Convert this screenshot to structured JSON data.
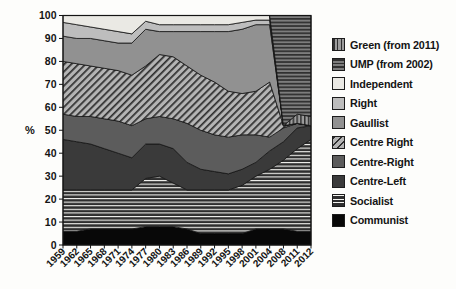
{
  "figure": {
    "ylabel": "%"
  },
  "chart_data": {
    "type": "area",
    "stacked": true,
    "title": "",
    "xlabel": "",
    "ylabel": "%",
    "ylim": [
      0,
      100
    ],
    "grid": false,
    "legend_position": "right",
    "y_ticks": [
      0,
      10,
      20,
      30,
      40,
      50,
      60,
      70,
      80,
      90,
      100
    ],
    "x_labels": [
      "1959",
      "1962",
      "1965",
      "1968",
      "1971",
      "1974",
      "1977",
      "1980",
      "1983",
      "1986",
      "1989",
      "1992",
      "1995",
      "1998",
      "2001",
      "2004",
      "2008",
      "2011",
      "2012"
    ],
    "series": [
      {
        "key": "communist",
        "label": "Communist",
        "pattern": "solid",
        "bg": "#080808",
        "fg": "#080808",
        "values": [
          6,
          6,
          7,
          7,
          7,
          7,
          8,
          8,
          8,
          7,
          5,
          5,
          5,
          5,
          7,
          7,
          7,
          6,
          6
        ]
      },
      {
        "key": "socialist",
        "label": "Socialist",
        "pattern": "horizontal",
        "bg": "#2e2e2e",
        "fg": "#f4f4f0",
        "stripe": {
          "period": 3.6,
          "fg_width": 1.1
        },
        "values": [
          18,
          18,
          17,
          17,
          17,
          17,
          21,
          22,
          19,
          17,
          19,
          19,
          19,
          21,
          23,
          26,
          30,
          36,
          40
        ]
      },
      {
        "key": "centre_left",
        "label": "Centre-Left",
        "pattern": "solid",
        "bg": "#3a3a3a",
        "fg": "#3a3a3a",
        "values": [
          22,
          21,
          20,
          18,
          16,
          14,
          15,
          14,
          15,
          12,
          9,
          8,
          7,
          7,
          6,
          8,
          8,
          9,
          6
        ]
      },
      {
        "key": "centre_right",
        "label": "Centre-Right",
        "pattern": "solid",
        "bg": "#5c5c5c",
        "fg": "#5c5c5c",
        "values": [
          11,
          11,
          12,
          13,
          14,
          14,
          11,
          12,
          13,
          17,
          17,
          16,
          16,
          15,
          12,
          6,
          6,
          2,
          0
        ]
      },
      {
        "key": "centre_right_hatch",
        "label": "Centre Right",
        "pattern": "diagonal",
        "bg": "#b4b4b4",
        "fg": "#2e2e2e",
        "stripe": {
          "period": 5,
          "fg_width": 1.7
        },
        "values": [
          23,
          23,
          22,
          22,
          22,
          22,
          23,
          27,
          27,
          25,
          24,
          23,
          20,
          18,
          19,
          24,
          1,
          0,
          0
        ]
      },
      {
        "key": "gaullist",
        "label": "Gaullist",
        "pattern": "solid",
        "bg": "#919191",
        "fg": "#919191",
        "values": [
          11,
          11,
          12,
          12,
          12,
          14,
          16,
          10,
          11,
          15,
          19,
          22,
          26,
          28,
          29,
          25,
          0,
          0,
          0
        ]
      },
      {
        "key": "right",
        "label": "Right",
        "pattern": "solid",
        "bg": "#bdbdbd",
        "fg": "#bdbdbd",
        "values": [
          6,
          6,
          5,
          5,
          5,
          4,
          3.5,
          3,
          3,
          3,
          3,
          3,
          3,
          3,
          2,
          2,
          0,
          0,
          0
        ]
      },
      {
        "key": "independent",
        "label": "Independent",
        "pattern": "solid",
        "bg": "#eae9e4",
        "fg": "#eae9e4",
        "values": [
          3,
          4,
          5,
          6,
          7,
          8,
          2.5,
          4,
          4,
          4,
          4,
          4,
          4,
          3,
          2,
          2,
          0,
          0,
          0
        ]
      },
      {
        "key": "green",
        "label": "Green (from 2011)",
        "pattern": "vertical",
        "bg": "#9c9c9c",
        "fg": "#2f2f2f",
        "stripe": {
          "period": 3.8,
          "fg_width": 1.5
        },
        "values": [
          0,
          0,
          0,
          0,
          0,
          0,
          0,
          0,
          0,
          0,
          0,
          0,
          0,
          0,
          0,
          0,
          0,
          4,
          4
        ]
      },
      {
        "key": "ump",
        "label": "UMP (from 2002)",
        "pattern": "horizontal",
        "bg": "#7d7d7d",
        "fg": "#303030",
        "stripe": {
          "period": 3.6,
          "fg_width": 1.7
        },
        "values": [
          0,
          0,
          0,
          0,
          0,
          0,
          0,
          0,
          0,
          0,
          0,
          0,
          0,
          0,
          0,
          0,
          48,
          43,
          44
        ]
      }
    ],
    "legend_order": [
      "green",
      "ump",
      "independent",
      "right",
      "gaullist",
      "centre_right_hatch",
      "centre_right",
      "centre_left",
      "socialist",
      "communist"
    ]
  }
}
